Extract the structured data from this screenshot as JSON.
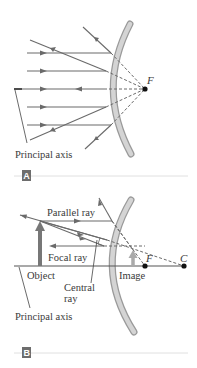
{
  "figure": {
    "colors": {
      "ray": "#6a6a6a",
      "mirror_fill": "#c9c9c9",
      "mirror_edge": "#9a9a9a",
      "point": "#111111",
      "object": "#777777",
      "badge": "#6d6d6d",
      "rule": "#d8d8d8",
      "text": "#3a3a3a"
    },
    "panel_a": {
      "badge": "A",
      "focal_label": "F",
      "axis_label": "Principal axis"
    },
    "panel_b": {
      "badge": "B",
      "parallel_ray_label": "Parallel ray",
      "focal_ray_label": "Focal ray",
      "central_ray_label_line1": "Central",
      "central_ray_label_line2": "ray",
      "object_label": "Object",
      "image_label": "Image",
      "focal_label": "F",
      "center_label": "C",
      "axis_label": "Principal axis"
    }
  }
}
